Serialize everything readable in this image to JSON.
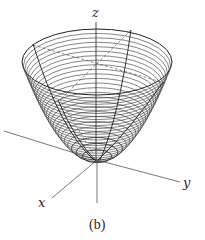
{
  "figure": {
    "caption": "(b)",
    "axes": {
      "x": {
        "label": "x"
      },
      "y": {
        "label": "y"
      },
      "z": {
        "label": "z"
      }
    },
    "surface": {
      "type": "paraboloid",
      "vertex": [
        97,
        160
      ],
      "rim_center_y": 62,
      "rim_rx": 75,
      "rim_ry_ratio": 0.44,
      "level_curves": 26,
      "stroke_color": "#333333"
    }
  }
}
